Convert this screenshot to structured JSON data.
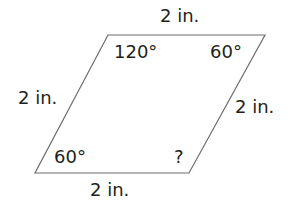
{
  "shape": {
    "type": "parallelogram",
    "stroke_color": "#6d6d6d",
    "vertices": {
      "top_left": [
        108,
        35
      ],
      "top_right": [
        265,
        35
      ],
      "bottom_right": [
        189,
        173
      ],
      "bottom_left": [
        35,
        173
      ]
    }
  },
  "sides": {
    "top": "2 in.",
    "left": "2 in.",
    "right": "2 in.",
    "bottom": "2 in."
  },
  "angles": {
    "top_left": "120°",
    "top_right": "60°",
    "bottom_left": "60°",
    "bottom_right": "?"
  }
}
